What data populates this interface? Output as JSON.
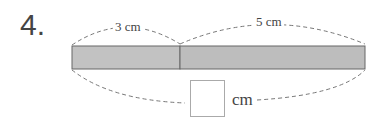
{
  "problem": {
    "number": "4.",
    "segments": [
      {
        "label": "3 cm",
        "length_cm": 3
      },
      {
        "label": "5 cm",
        "length_cm": 5
      }
    ],
    "answer_box": {
      "value": "",
      "unit": "cm"
    }
  },
  "colors": {
    "bar_fill": "#bdbdbd",
    "bar_border": "#666666",
    "dash": "#777777"
  }
}
